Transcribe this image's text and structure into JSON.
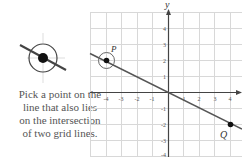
{
  "caption": {
    "line1": "Pick a point on the",
    "line2": "line that also lies",
    "line3": "on the intersection",
    "line4": "of two grid lines."
  },
  "graph": {
    "y_axis_label": "y",
    "x_ticks": [
      "-4",
      "-3",
      "-2",
      "-1",
      "1",
      "2",
      "3",
      "4"
    ],
    "y_ticks": [
      "4",
      "3",
      "2",
      "1",
      "-1",
      "-2",
      "-3",
      "-4"
    ],
    "points": [
      {
        "label": "P",
        "x": -4,
        "y": 2
      },
      {
        "label": "Q",
        "x": 4,
        "y": -2
      }
    ],
    "line_equation": "y = -x/2"
  },
  "colors": {
    "grid": "#d8d8d8",
    "axis": "#444444",
    "line": "#555555",
    "point": "#111111"
  }
}
